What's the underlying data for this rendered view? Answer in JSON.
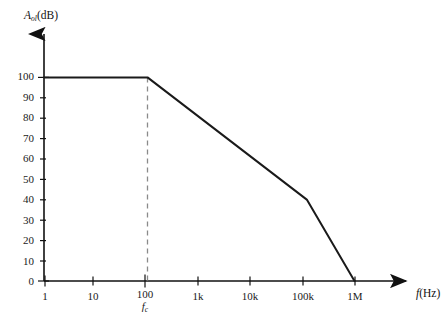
{
  "chart_data": {
    "type": "line",
    "title": "",
    "subtitle": "",
    "xlabel": "f(Hz)",
    "ylabel": "Aol(dB)",
    "xlabel_display": "f(Hz)",
    "ylabel_display": "Aol(dB)",
    "ylabel_main": "A",
    "ylabel_sub": "ol",
    "ylabel_unit": "(dB)",
    "xlabel_main": "f",
    "xlabel_unit": "(Hz)",
    "x_scale": "log",
    "y_scale": "linear",
    "xlim": [
      1,
      1000000
    ],
    "ylim": [
      0,
      100
    ],
    "grid": false,
    "legend": null,
    "x_ticks": [
      {
        "value": 1,
        "label": "1"
      },
      {
        "value": 10,
        "label": "10"
      },
      {
        "value": 100,
        "label": "100"
      },
      {
        "value": 1000,
        "label": "1k"
      },
      {
        "value": 10000,
        "label": "10k"
      },
      {
        "value": 100000,
        "label": "100k"
      },
      {
        "value": 1000000,
        "label": "1M"
      }
    ],
    "y_ticks": [
      {
        "value": 0,
        "label": "0"
      },
      {
        "value": 10,
        "label": "10"
      },
      {
        "value": 20,
        "label": "20"
      },
      {
        "value": 30,
        "label": "30"
      },
      {
        "value": 40,
        "label": "40"
      },
      {
        "value": 50,
        "label": "50"
      },
      {
        "value": 60,
        "label": "60"
      },
      {
        "value": 70,
        "label": "70"
      },
      {
        "value": 80,
        "label": "80"
      },
      {
        "value": 90,
        "label": "90"
      },
      {
        "value": 100,
        "label": "100"
      }
    ],
    "series": [
      {
        "name": "open-loop-gain",
        "color": "#1a1a1a",
        "points": [
          {
            "x": 1,
            "y": 100
          },
          {
            "x": 100,
            "y": 100
          },
          {
            "x": 120000,
            "y": 40
          },
          {
            "x": 1000000,
            "y": 0
          }
        ]
      }
    ],
    "annotations": [
      {
        "name": "cutoff-frequency-marker",
        "type": "vertical-dashed-line",
        "x": 100,
        "y_from": 0,
        "y_to": 100,
        "label": "fc",
        "label_main": "f",
        "label_sub": "c",
        "color": "#8a8a8a"
      }
    ]
  }
}
